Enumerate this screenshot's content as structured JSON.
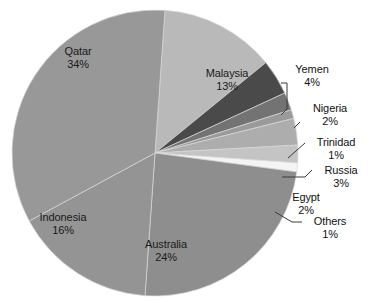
{
  "chart_data": {
    "type": "pie",
    "title": "",
    "subtitle": "",
    "xlabel": "",
    "ylabel": "",
    "legend_position": "none",
    "grid": false,
    "units": "percent",
    "total": 100,
    "categories": [
      "Qatar",
      "Australia",
      "Indonesia",
      "Malaysia",
      "Yemen",
      "Russia",
      "Nigeria",
      "Egypt",
      "Trinidad",
      "Others"
    ],
    "values": [
      34,
      24,
      16,
      13,
      4,
      3,
      2,
      2,
      1,
      1
    ],
    "slices": [
      {
        "label": "Malaysia",
        "value": 13,
        "percent_text": "13%",
        "color": "#b9b9b9",
        "label_placement": "inside"
      },
      {
        "label": "Yemen",
        "value": 4,
        "percent_text": "4%",
        "color": "#4a4a4a",
        "label_placement": "outside"
      },
      {
        "label": "Nigeria",
        "value": 2,
        "percent_text": "2%",
        "color": "#737373",
        "label_placement": "outside"
      },
      {
        "label": "Trinidad",
        "value": 1,
        "percent_text": "1%",
        "color": "#9a9a9a",
        "label_placement": "outside"
      },
      {
        "label": "Russia",
        "value": 3,
        "percent_text": "3%",
        "color": "#adadad",
        "label_placement": "outside"
      },
      {
        "label": "Egypt",
        "value": 2,
        "percent_text": "2%",
        "color": "#c4c4c4",
        "label_placement": "outside"
      },
      {
        "label": "Others",
        "value": 1,
        "percent_text": "1%",
        "color": "#f4f4f4",
        "label_placement": "outside"
      },
      {
        "label": "Australia",
        "value": 24,
        "percent_text": "24%",
        "color": "#8e8e8e",
        "label_placement": "inside"
      },
      {
        "label": "Indonesia",
        "value": 16,
        "percent_text": "16%",
        "color": "#949494",
        "label_placement": "inside"
      },
      {
        "label": "Qatar",
        "value": 34,
        "percent_text": "34%",
        "color": "#989898",
        "label_placement": "inside"
      }
    ]
  },
  "labels": {
    "qatar": {
      "name": "Qatar",
      "pct": "34%"
    },
    "malaysia": {
      "name": "Malaysia",
      "pct": "13%"
    },
    "yemen": {
      "name": "Yemen",
      "pct": "4%"
    },
    "nigeria": {
      "name": "Nigeria",
      "pct": "2%"
    },
    "trinidad": {
      "name": "Trinidad",
      "pct": "1%"
    },
    "russia": {
      "name": "Russia",
      "pct": "3%"
    },
    "egypt": {
      "name": "Egypt",
      "pct": "2%"
    },
    "others": {
      "name": "Others",
      "pct": "1%"
    },
    "australia": {
      "name": "Australia",
      "pct": "24%"
    },
    "indonesia": {
      "name": "Indonesia",
      "pct": "16%"
    }
  },
  "style": {
    "background": "#ffffff",
    "text_color": "#111111",
    "leader_color": "#3a3a3a",
    "slice_edge": "#d7d7d7"
  },
  "geometry": {
    "center_x": 155,
    "center_y": 153,
    "radius": 143,
    "start_angle_deg": -86
  }
}
